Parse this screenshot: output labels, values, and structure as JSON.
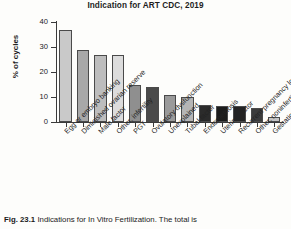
{
  "chart_data": {
    "type": "bar",
    "title": "Indication for ART CDC, 2019",
    "xlabel": "",
    "ylabel": "% of cycles",
    "ylim": [
      0,
      40
    ],
    "yticks": [
      0,
      10,
      20,
      30,
      40
    ],
    "grid": false,
    "legend": "none",
    "categories": [
      "Egg or embryo banking",
      "Diminished ovarian reserve",
      "Male factor",
      "Other, infertility",
      "PGT",
      "Ovulatory dysfunction",
      "Unexplained",
      "Tubal factor",
      "Endometriosis",
      "Uterine factor",
      "Recurrent pregnancy loss",
      "Other, noninfertility",
      "Gestational carrier"
    ],
    "values": [
      37,
      29,
      27,
      27,
      15,
      14,
      11,
      10,
      7,
      6.3,
      6.3,
      5.6,
      2
    ],
    "bar_colors": [
      "#c9c9c9",
      "#a8a8a8",
      "#bdbdbd",
      "#dcdcdc",
      "#8f8f8f",
      "#4a4a4a",
      "#9a9a9a",
      "#b5b5b5",
      "#2b2b2b",
      "#1c1c1c",
      "#232323",
      "#3c3c3c",
      "#c4c4c4"
    ]
  },
  "caption": {
    "figure_number": "Fig. 23.1",
    "text": "Indications for In Vitro Fertilization. The total is"
  }
}
